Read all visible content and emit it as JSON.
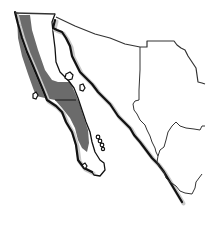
{
  "map": {
    "region": "Baja California peninsula and northwestern Mexico",
    "legend_text": null,
    "colors": {
      "background": "#ffffff",
      "range_fill": "#6b6b6b",
      "outline": "#111111",
      "shadow": "#c8c8c8"
    },
    "features": [
      {
        "name": "baja-california-peninsula",
        "shaded": true
      },
      {
        "name": "gulf-of-california",
        "shaded": false
      },
      {
        "name": "mainland-mexico-states",
        "shaded": false
      },
      {
        "name": "gulf-islands",
        "shaded": false
      }
    ]
  }
}
